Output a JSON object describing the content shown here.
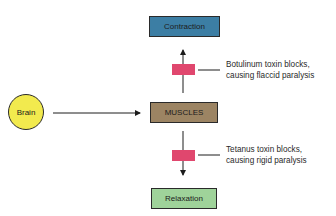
{
  "diagram": {
    "nodes": {
      "brain": {
        "label": "Brain",
        "color": "#f2ea4e"
      },
      "muscles": {
        "label": "MUSCLES",
        "color": "#9c8463"
      },
      "contraction": {
        "label": "Contraction",
        "color": "#3c7ea4"
      },
      "relaxation": {
        "label": "Relaxation",
        "color": "#9fd39a"
      }
    },
    "blocks": {
      "botulinum": {
        "color": "#e0476e",
        "line1": "Botulinum toxin blocks,",
        "line2": "causing flaccid paralysis"
      },
      "tetanus": {
        "color": "#e0476e",
        "line1": "Tetanus toxin blocks,",
        "line2": "causing rigid paralysis"
      }
    },
    "edges": [
      {
        "from": "Brain",
        "to": "MUSCLES"
      },
      {
        "from": "MUSCLES",
        "to": "Contraction",
        "blocked_by": "Botulinum toxin"
      },
      {
        "from": "MUSCLES",
        "to": "Relaxation",
        "blocked_by": "Tetanus toxin"
      }
    ]
  }
}
